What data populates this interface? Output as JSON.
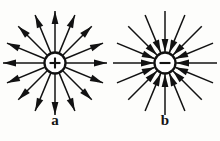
{
  "figure": {
    "type": "electric-field-lines",
    "background_color": "#fdfdfb",
    "ink_color": "#121212",
    "panels": [
      {
        "id": "a",
        "label": "a",
        "charge_sign": "+",
        "charge_symbol": "+",
        "charge_polarity": "positive",
        "field_direction": "outward",
        "ray_count": 16,
        "center_x": 55,
        "center_y": 63,
        "charge_radius": 10.5,
        "ray_inner_radius": 11,
        "ray_outer_radius": 52,
        "arrowhead_position": "outer-end",
        "arrowhead_length": 13,
        "arrowhead_half_width": 3.4
      },
      {
        "id": "b",
        "label": "b",
        "charge_sign": "-",
        "charge_symbol": "−",
        "charge_polarity": "negative",
        "field_direction": "inward",
        "ray_count": 16,
        "center_x": 55,
        "center_y": 63,
        "charge_radius": 10.5,
        "ray_inner_radius": 11,
        "ray_outer_radius": 52,
        "arrowhead_position": "inner-end",
        "arrowhead_length": 13,
        "arrowhead_half_width": 3.4
      }
    ]
  }
}
